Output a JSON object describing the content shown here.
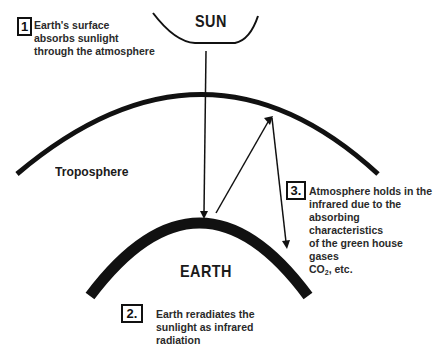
{
  "diagram": {
    "labels": {
      "sun": "SUN",
      "earth": "EARTH",
      "troposphere": "Troposphere"
    },
    "steps": [
      {
        "number": "1",
        "lines": [
          "Earth's surface",
          "absorbs sunlight",
          "through the atmosphere"
        ]
      },
      {
        "number": "2.",
        "lines": [
          "Earth reradiates the",
          "sunlight as infrared",
          "radiation"
        ]
      },
      {
        "number": "3.",
        "lines": [
          "Atmosphere holds in the",
          "infrared due to the",
          "absorbing characteristics",
          "of the green house gases"
        ],
        "last_line_prefix": "CO",
        "last_line_subscript": "2",
        "last_line_suffix": ", etc."
      }
    ],
    "colors": {
      "ink": "#111111",
      "text": "#2a2a2a",
      "background": "#ffffff"
    }
  }
}
